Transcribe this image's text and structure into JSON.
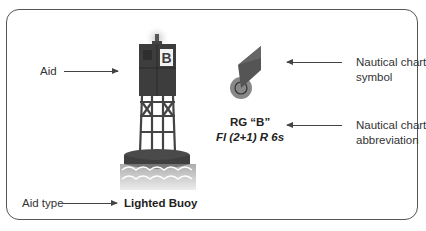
{
  "labels": {
    "aid": "Aid",
    "aid_type": "Aid type",
    "aid_type_value": "Lighted Buoy",
    "chart_symbol": [
      "Nautical chart",
      "symbol"
    ],
    "chart_abbreviation": [
      "Nautical chart",
      "abbreviation"
    ]
  },
  "buoy": {
    "letter": "B"
  },
  "abbreviation": {
    "line1": "RG “B”",
    "line2": "Fl (2+1) R 6s"
  },
  "colors": {
    "frame": "#555555",
    "buoy_dark": "#3a3a3a",
    "buoy_mid": "#555555",
    "water_light": "#bdbdbd",
    "text": "#333333"
  }
}
